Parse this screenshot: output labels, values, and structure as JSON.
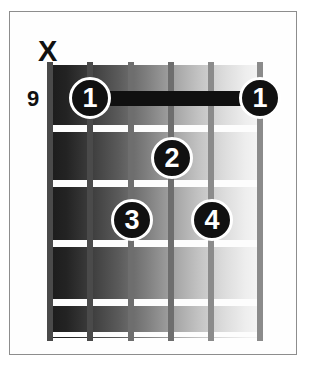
{
  "diagram": {
    "starting_fret_label": "9",
    "strings_count": 6,
    "frets_count": 5,
    "colors": {
      "frame": "#8d8d8d",
      "dot_fill": "#111111",
      "dot_text": "#ffffff",
      "barre": "#101010",
      "fret_line": "#fdfdfd",
      "string": "#6e6e6e",
      "background": "#ffffff"
    }
  },
  "markers": {
    "muted": [
      {
        "label": "X",
        "string": 1,
        "x": 38,
        "y": 37
      }
    ]
  },
  "barres": [
    {
      "fret": 1,
      "from_string": 2,
      "to_string": 6,
      "x": 90,
      "y": 91,
      "width": 172
    }
  ],
  "fingers": [
    {
      "label": "1",
      "string": 2,
      "fret": 1,
      "x": 69,
      "y": 77
    },
    {
      "label": "1",
      "string": 6,
      "fret": 1,
      "x": 239,
      "y": 77
    },
    {
      "label": "2",
      "string": 4,
      "fret": 2,
      "x": 151,
      "y": 137
    },
    {
      "label": "3",
      "string": 3,
      "fret": 3,
      "x": 111,
      "y": 199
    },
    {
      "label": "4",
      "string": 5,
      "fret": 3,
      "x": 191,
      "y": 199
    }
  ],
  "fret_lines": [
    {
      "y": 125
    },
    {
      "y": 180
    },
    {
      "y": 240
    },
    {
      "y": 299
    },
    {
      "y": 332
    }
  ],
  "strings": [
    {
      "index": 1,
      "x": 47,
      "shade": "dark"
    },
    {
      "index": 2,
      "x": 87,
      "shade": "dark"
    },
    {
      "index": 3,
      "x": 128,
      "shade": "normal"
    },
    {
      "index": 4,
      "x": 168,
      "shade": "normal"
    },
    {
      "index": 5,
      "x": 208,
      "shade": "light"
    },
    {
      "index": 6,
      "x": 257,
      "shade": "light"
    }
  ]
}
